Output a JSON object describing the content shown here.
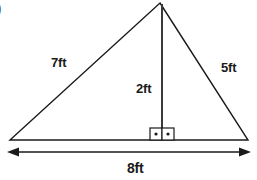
{
  "figure": {
    "type": "geometry-diagram",
    "shape": "triangle-with-altitude",
    "question_marker": ")",
    "labels": {
      "left_side": "7ft",
      "right_side": "5ft",
      "altitude": "2ft",
      "base": "8ft"
    },
    "markers": {
      "right_angle_count": 2,
      "right_angle_style": "square-with-center-dot"
    },
    "geometry": {
      "apex": [
        160,
        3
      ],
      "bottom_left": [
        10,
        140
      ],
      "bottom_right": [
        248,
        140
      ],
      "altitude_foot": [
        162,
        140
      ],
      "dimension_line_y": 152,
      "dimension_arrow_left_x": 8,
      "dimension_arrow_right_x": 250
    },
    "colors": {
      "stroke": "#1a1a1a",
      "background": "#ffffff",
      "text": "#1a1a1a"
    }
  }
}
